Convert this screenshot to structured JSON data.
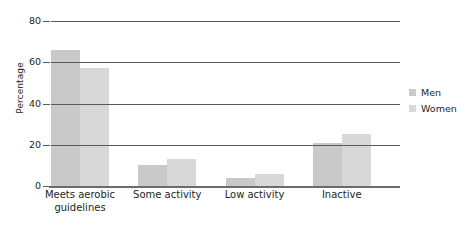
{
  "chart_data": {
    "type": "bar",
    "title": "",
    "xlabel": "",
    "ylabel": "Percentage",
    "ylim": [
      0,
      80
    ],
    "yticks": [
      0,
      20,
      40,
      60,
      80
    ],
    "ytick_labels": [
      "0",
      "20",
      "40",
      "60",
      "80"
    ],
    "grid": true,
    "legend_position": "right",
    "categories": [
      "Meets aerobic guidelines",
      "Some activity",
      "Low activity",
      "Inactive"
    ],
    "category_lines": [
      [
        "Meets aerobic",
        "guidelines"
      ],
      [
        "Some activity"
      ],
      [
        "Low activity"
      ],
      [
        "Inactive"
      ]
    ],
    "series": [
      {
        "name": "Men",
        "color": "#c9c9c9",
        "values": [
          66,
          10,
          4,
          21
        ]
      },
      {
        "name": "Women",
        "color": "#d8d8d8",
        "values": [
          57,
          13,
          6,
          25
        ]
      }
    ]
  }
}
